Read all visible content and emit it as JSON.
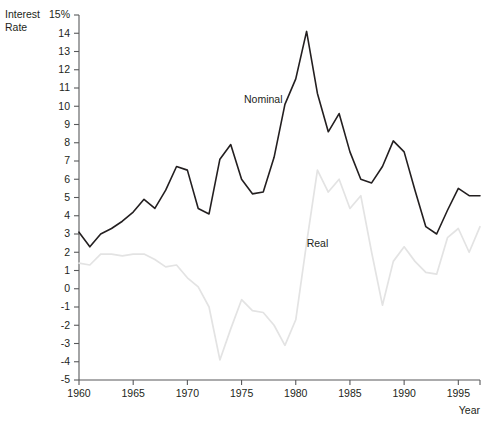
{
  "chart_data": {
    "type": "line",
    "title": "",
    "xlabel": "Year",
    "ylabel": "Interest Rate",
    "ylabel_line1": "Interest",
    "ylabel_line2": "Rate",
    "xlim": [
      1960,
      1997
    ],
    "ylim": [
      -5,
      15
    ],
    "grid": false,
    "legend": "inline-annotations",
    "ytick_labels": [
      "15%",
      "14",
      "13",
      "12",
      "11",
      "10",
      "9",
      "8",
      "7",
      "6",
      "5",
      "4",
      "3",
      "2",
      "1",
      "0",
      "-1",
      "-2",
      "-3",
      "-4",
      "-5"
    ],
    "ytick_values": [
      15,
      14,
      13,
      12,
      11,
      10,
      9,
      8,
      7,
      6,
      5,
      4,
      3,
      2,
      1,
      0,
      -1,
      -2,
      -3,
      -4,
      -5
    ],
    "xtick_labels": [
      "1960",
      "1965",
      "1970",
      "1975",
      "1980",
      "1985",
      "1990",
      "1995"
    ],
    "xtick_values": [
      1960,
      1965,
      1970,
      1975,
      1980,
      1985,
      1990,
      1995
    ],
    "x": [
      1960,
      1961,
      1962,
      1963,
      1964,
      1965,
      1966,
      1967,
      1968,
      1969,
      1970,
      1971,
      1972,
      1973,
      1974,
      1975,
      1976,
      1977,
      1978,
      1979,
      1980,
      1981,
      1982,
      1983,
      1984,
      1985,
      1986,
      1987,
      1988,
      1989,
      1990,
      1991,
      1992,
      1993,
      1994,
      1995,
      1996,
      1997
    ],
    "series": [
      {
        "name": "Nominal",
        "color": "#231f20",
        "label_x": 1977,
        "label_y": 10.2,
        "values": [
          3.1,
          2.3,
          3.0,
          3.3,
          3.7,
          4.2,
          4.9,
          4.4,
          5.4,
          6.7,
          6.5,
          4.4,
          4.1,
          7.1,
          7.9,
          6.0,
          5.2,
          5.3,
          7.2,
          10.1,
          11.5,
          14.1,
          10.7,
          8.6,
          9.6,
          7.5,
          6.0,
          5.8,
          6.7,
          8.1,
          7.5,
          5.4,
          3.4,
          3.0,
          4.3,
          5.5,
          5.1,
          5.1
        ]
      },
      {
        "name": "Real",
        "color": "#e3e3e3",
        "label_x": 1982,
        "label_y": 2.3,
        "values": [
          1.4,
          1.3,
          1.9,
          1.9,
          1.8,
          1.9,
          1.9,
          1.6,
          1.2,
          1.3,
          0.6,
          0.1,
          -1.0,
          -3.9,
          -2.2,
          -0.6,
          -1.2,
          -1.3,
          -2.0,
          -3.1,
          -1.7,
          2.5,
          6.5,
          5.3,
          6.0,
          4.4,
          5.1,
          2.0,
          -0.9,
          1.5,
          2.3,
          1.5,
          0.9,
          0.8,
          2.8,
          3.3,
          2.0,
          3.4
        ]
      }
    ]
  },
  "geometry": {
    "plot_left": 79,
    "plot_right": 480,
    "plot_top": 15,
    "plot_bottom": 380
  }
}
